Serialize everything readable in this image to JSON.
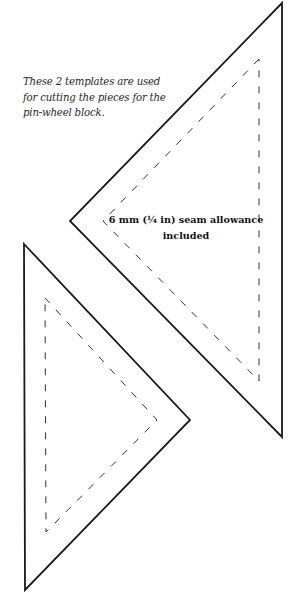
{
  "caption": {
    "lines": [
      "These 2 templates are used",
      "for cutting the pieces for the",
      "pin-wheel block."
    ]
  },
  "seam_label": {
    "line1": "6 mm (¼ in) seam allowance",
    "line2": "included"
  },
  "templates": [
    {
      "name": "top-template",
      "cut_line": [
        [
          282,
          3
        ],
        [
          70,
          221
        ],
        [
          282,
          437
        ]
      ],
      "seam_line": [
        [
          259,
          59
        ],
        [
          103,
          221
        ],
        [
          259,
          381
        ]
      ]
    },
    {
      "name": "bottom-template",
      "cut_line": [
        [
          24,
          244
        ],
        [
          190,
          420
        ],
        [
          25,
          590
        ]
      ],
      "seam_line": [
        [
          45,
          298
        ],
        [
          157,
          420
        ],
        [
          46,
          532
        ]
      ]
    }
  ],
  "colors": {
    "cut_line": "#1a1a1a",
    "seam_line": "#333333",
    "background": "#ffffff"
  }
}
